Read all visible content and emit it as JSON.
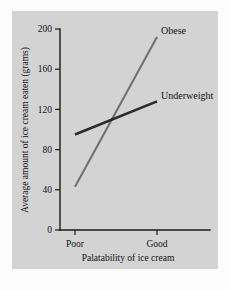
{
  "figure": {
    "background_color": "#fdfdfd",
    "panel_color": "#d3d3d3"
  },
  "chart_data": {
    "type": "line",
    "title": "",
    "subtitle": "",
    "xlabel": "Palatability of ice cream",
    "ylabel": "Average amount of ice cream eaten (grams)",
    "categories": [
      "Poor",
      "Good"
    ],
    "x_tick_labels": [
      "Poor",
      "Good"
    ],
    "y_tick_labels": [
      "0",
      "40",
      "80",
      "120",
      "160",
      "200"
    ],
    "y_ticks": [
      0,
      40,
      80,
      120,
      160,
      200
    ],
    "ylim": [
      0,
      200
    ],
    "grid": false,
    "legend_position": "inline-right-of-line-ends",
    "series": [
      {
        "name": "Obese",
        "label": "Obese",
        "color": "#6e6e6e",
        "stroke_width": 2.0,
        "values": [
          43,
          192
        ]
      },
      {
        "name": "Underweight",
        "label": "Underweight",
        "color": "#2b2b2b",
        "stroke_width": 2.6,
        "values": [
          95,
          128
        ]
      }
    ],
    "annotations": [
      {
        "text": "Obese",
        "series": "Obese",
        "position": "end"
      },
      {
        "text": "Underweight",
        "series": "Underweight",
        "position": "end"
      }
    ]
  }
}
